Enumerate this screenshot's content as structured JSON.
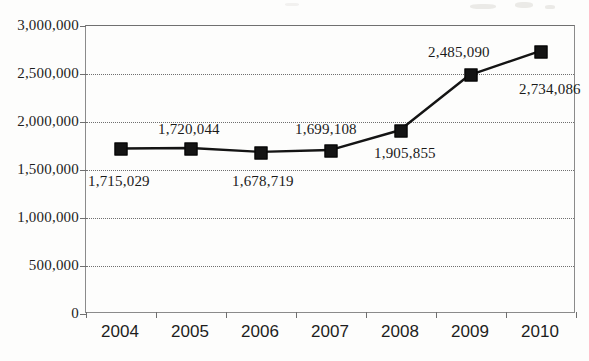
{
  "chart_data": {
    "type": "line",
    "title": "",
    "xlabel": "",
    "ylabel": "",
    "categories": [
      "2004",
      "2005",
      "2006",
      "2007",
      "2008",
      "2009",
      "2010"
    ],
    "values": [
      1715029,
      1720044,
      1678719,
      1699108,
      1905855,
      2485090,
      2734086
    ],
    "point_labels": [
      "1,715,029",
      "1,720,044",
      "1,678,719",
      "1,699,108",
      "1,905,855",
      "2,485,090",
      "2,734,086"
    ],
    "ylim": [
      0,
      3000000
    ],
    "ytick_values": [
      0,
      500000,
      1000000,
      1500000,
      2000000,
      2500000,
      3000000
    ],
    "ytick_labels": [
      "0",
      "500,000",
      "1,000,000",
      "1,500,000",
      "2,000,000",
      "2,500,000",
      "3,000,000"
    ],
    "grid": "horizontal-dotted",
    "legend": "none",
    "marker": "filled-square",
    "series_color": "#141414"
  },
  "axis": {
    "y_labels": [
      "3,000,000",
      "2,500,000",
      "2,000,000",
      "1,500,000",
      "1,000,000",
      "500,000",
      "0"
    ],
    "x_labels": [
      "2004",
      "2005",
      "2006",
      "2007",
      "2008",
      "2009",
      "2010"
    ]
  },
  "labels": {
    "p2004": "1,715,029",
    "p2005": "1,720,044",
    "p2006": "1,678,719",
    "p2007": "1,699,108",
    "p2008": "1,905,855",
    "p2009": "2,485,090",
    "p2010": "2,734,086"
  },
  "colors": {
    "line": "#141414",
    "grid": "#6f6f6f",
    "frame": "#8b8b8b",
    "text": "#1d1d1d",
    "background": "#fdfdfc"
  }
}
